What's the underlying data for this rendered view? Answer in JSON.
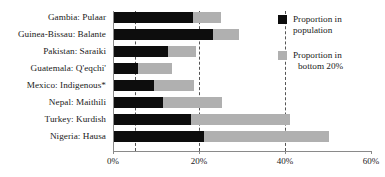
{
  "chart_data": {
    "type": "bar",
    "orientation": "horizontal",
    "stacked": true,
    "title": "",
    "xlabel": "",
    "ylabel": "",
    "xlim": [
      0,
      60
    ],
    "xunit": "%",
    "grid": true,
    "gridlines": [
      5,
      20,
      40
    ],
    "xticks": [
      0,
      20,
      40,
      60
    ],
    "xtick_labels": [
      "0%",
      "20%",
      "40%",
      "60%"
    ],
    "legend_position": "right",
    "categories": [
      "Gambia: Pulaar",
      "Guinea-Bissau: Balante",
      "Pakistan: Saraiki",
      "Guatemala: Q'eqchi'",
      "Mexico: Indigenous*",
      "Nepal: Maithili",
      "Turkey: Kurdish",
      "Nigeria: Hausa"
    ],
    "series": [
      {
        "name": "Proportion in population",
        "color": "#0d0d0d",
        "values": [
          18.3,
          23.0,
          12.5,
          5.5,
          9.3,
          11.4,
          18.0,
          21.0
        ]
      },
      {
        "name": "Proportion in bottom 20%",
        "color": "#b0b0b0",
        "values": [
          24.9,
          29.0,
          19.0,
          13.5,
          18.5,
          25.0,
          41.0,
          50.0
        ]
      }
    ]
  },
  "legend": {
    "items": [
      {
        "label_line1": "Proportion in",
        "label_line2": "population",
        "color": "#0d0d0d"
      },
      {
        "label_line1": "Proportion in",
        "label_line2": "bottom 20%",
        "color": "#b0b0b0"
      }
    ]
  }
}
